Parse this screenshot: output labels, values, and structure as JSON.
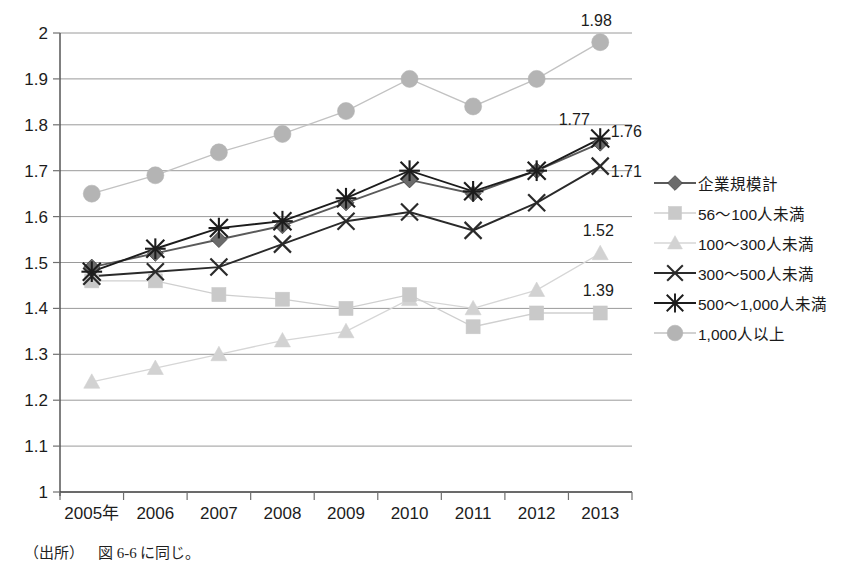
{
  "chart_data": {
    "type": "line",
    "title": "",
    "xlabel": "",
    "ylabel": "",
    "categories": [
      "2005年",
      "2006",
      "2007",
      "2008",
      "2009",
      "2010",
      "2011",
      "2012",
      "2013"
    ],
    "x_tick_labels": [
      "2005年",
      "2006",
      "2007",
      "2008",
      "2009",
      "2010",
      "2011",
      "2012",
      "2013"
    ],
    "y_tick_labels": [
      "2",
      "1.9",
      "1.8",
      "1.7",
      "1.6",
      "1.5",
      "1.4",
      "1.3",
      "1.2",
      "1.1",
      "1"
    ],
    "y_tick_values": [
      2,
      1.9,
      1.8,
      1.7,
      1.6,
      1.5,
      1.4,
      1.3,
      1.2,
      1.1,
      1
    ],
    "ylim": [
      1,
      2
    ],
    "grid": true,
    "legend_position": "right",
    "series": [
      {
        "name": "企業規模計",
        "marker": "diamond",
        "color": "#6b6b6b",
        "line_color": "#5a5a5a",
        "values": [
          1.49,
          1.52,
          1.55,
          1.58,
          1.63,
          1.68,
          1.65,
          1.7,
          1.76
        ],
        "end_label": "1.76"
      },
      {
        "name": "56〜100人未満",
        "marker": "square",
        "color": "#c9c9c9",
        "line_color": "#cfcfcf",
        "values": [
          1.46,
          1.46,
          1.43,
          1.42,
          1.4,
          1.43,
          1.36,
          1.39,
          1.39
        ],
        "end_label": "1.39"
      },
      {
        "name": "100〜300人未満",
        "marker": "triangle",
        "color": "#d2d2d2",
        "line_color": "#d6d6d6",
        "values": [
          1.24,
          1.27,
          1.3,
          1.33,
          1.35,
          1.42,
          1.4,
          1.44,
          1.52
        ],
        "end_label": "1.52"
      },
      {
        "name": "300〜500人未満",
        "marker": "x",
        "color": "#2a2a2a",
        "line_color": "#2a2a2a",
        "values": [
          1.47,
          1.48,
          1.49,
          1.54,
          1.59,
          1.61,
          1.57,
          1.63,
          1.71
        ],
        "end_label": "1.71"
      },
      {
        "name": "500〜1,000人未満",
        "marker": "asterisk",
        "color": "#1c1c1c",
        "line_color": "#1c1c1c",
        "values": [
          1.48,
          1.53,
          1.575,
          1.59,
          1.64,
          1.7,
          1.655,
          1.7,
          1.77
        ],
        "end_label": "1.77"
      },
      {
        "name": "1,000人以上",
        "marker": "circle",
        "color": "#b4b4b4",
        "line_color": "#c2c2c2",
        "values": [
          1.65,
          1.69,
          1.74,
          1.78,
          1.83,
          1.9,
          1.84,
          1.9,
          1.98
        ],
        "end_label": "1.98"
      }
    ],
    "data_labels": [
      "1.98",
      "1.77",
      "1.76",
      "1.71",
      "1.52",
      "1.39"
    ]
  },
  "legend": {
    "items": [
      {
        "label": "企業規模計"
      },
      {
        "label": "56〜100人未満"
      },
      {
        "label": "100〜300人未満"
      },
      {
        "label": "300〜500人未満"
      },
      {
        "label": "500〜1,000人未満"
      },
      {
        "label": "1,000人以上"
      }
    ]
  },
  "footer": {
    "source_prefix": "（出所）",
    "source_text": "図 6-6 に同じ。"
  }
}
